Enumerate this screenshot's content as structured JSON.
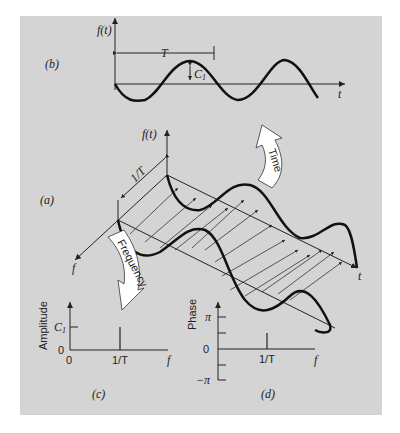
{
  "panels": {
    "b": {
      "label": "(b)",
      "y_axis": "f(t)",
      "x_axis": "t",
      "period_label": "T",
      "amplitude_label": "C",
      "amplitude_subscript": "1"
    },
    "a": {
      "label": "(a)",
      "y_axis": "f(t)",
      "x_axis": "t",
      "freq_axis": "f",
      "freq_spacing_label": "1/T"
    },
    "c": {
      "label": "(c)",
      "y_axis": "Amplitude",
      "x_axis": "f",
      "y_tick": "C",
      "y_tick_sub": "1",
      "origin_y": "0",
      "origin_x": "0",
      "x_tick": "1/T"
    },
    "d": {
      "label": "(d)",
      "y_axis": "Phase",
      "x_axis": "f",
      "y_ticks": [
        "π",
        "0",
        "−π"
      ],
      "x_tick": "1/T"
    }
  },
  "arrows": {
    "time": "Time",
    "frequency": "Frequency"
  },
  "colors": {
    "panel_bg": "#d4d4d4",
    "ink": "#111111",
    "arrow_fill": "#ffffff"
  }
}
